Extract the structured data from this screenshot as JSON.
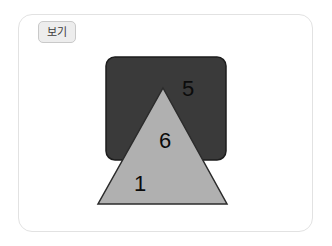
{
  "card": {
    "label_tab": "보기",
    "background": "#ffffff",
    "border_color": "#e2e2e2"
  },
  "figure": {
    "title": "보기",
    "shapes": [
      {
        "name": "rectangle",
        "kind": "rounded-rectangle",
        "fill": "#3a3a3a",
        "stroke": "#1d1d1d",
        "x": 106,
        "y": 57,
        "width": 120,
        "height": 103,
        "corner_radius": 9
      },
      {
        "name": "triangle",
        "kind": "triangle",
        "fill": "#b0b0b0",
        "stroke": "#2b2b2b",
        "apex": [
          163,
          88
        ],
        "base_left": [
          98,
          204
        ],
        "base_right": [
          227,
          204
        ]
      }
    ],
    "regions": [
      {
        "name": "rectangle-only-region",
        "number": "5",
        "fill": "#3a3a3a"
      },
      {
        "name": "overlap-region",
        "number": "6",
        "fill": "#b0b0b0"
      },
      {
        "name": "triangle-only-region",
        "number": "1",
        "fill": "#b0b0b0"
      }
    ]
  },
  "colors": {
    "dark_shape": "#3a3a3a",
    "light_shape": "#b0b0b0",
    "number_text": "#0b0b0b",
    "tab_fill": "#ededed",
    "tab_border": "#c9c9c9"
  }
}
